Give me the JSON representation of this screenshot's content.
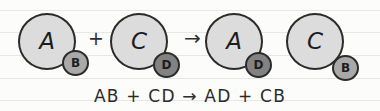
{
  "diagram": {
    "background_color": "#fcfcfb",
    "ruled_line_color": "#e7e7e5",
    "outline_color": "#2b2b2b",
    "text_color": "#1d1d1d",
    "ruled_lines": [
      10,
      32,
      55,
      78,
      100
    ],
    "molecules": [
      {
        "side": "reactant",
        "large_atom": {
          "label": "A",
          "fill": "#dcdcdc",
          "size": "large"
        },
        "small_atom": {
          "label": "B",
          "fill": "#a9a9a9",
          "size": "small"
        }
      },
      {
        "side": "reactant",
        "large_atom": {
          "label": "C",
          "fill": "#dcdcdc",
          "size": "large"
        },
        "small_atom": {
          "label": "D",
          "fill": "#828282",
          "size": "small"
        }
      },
      {
        "side": "product",
        "large_atom": {
          "label": "A",
          "fill": "#dcdcdc",
          "size": "large"
        },
        "small_atom": {
          "label": "D",
          "fill": "#828282",
          "size": "small"
        }
      },
      {
        "side": "product",
        "large_atom": {
          "label": "C",
          "fill": "#dcdcdc",
          "size": "large"
        },
        "small_atom": {
          "label": "B",
          "fill": "#a9a9a9",
          "size": "small"
        }
      }
    ],
    "operators": {
      "plus_reactants": "+",
      "reaction_arrow": "→",
      "plus_products": "+"
    },
    "caption": "AB + CD → AD + CB"
  }
}
